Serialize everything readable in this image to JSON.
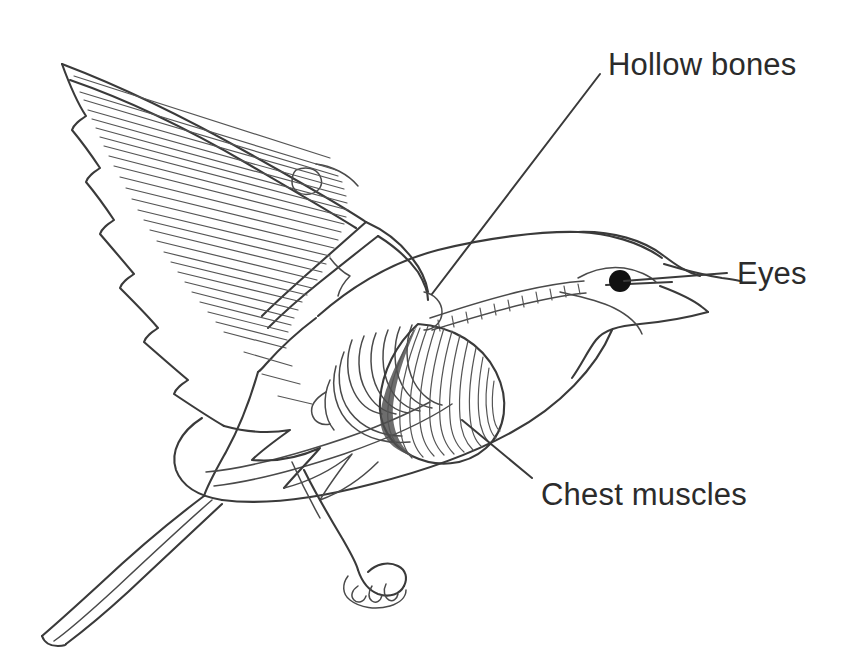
{
  "figure": {
    "background_color": "#ffffff",
    "ink_color": "#3a3a3a",
    "text_color": "#2b2b2b",
    "width": 850,
    "height": 667
  },
  "labels": [
    {
      "id": "hollow-bones",
      "text": "Hollow bones",
      "x": 608,
      "y": 75,
      "anchor": "start",
      "leader": {
        "x1": 600,
        "y1": 74,
        "x2": 432,
        "y2": 294
      }
    },
    {
      "id": "eyes",
      "text": "Eyes",
      "x": 737,
      "y": 284,
      "anchor": "start",
      "leader": {
        "x1": 727,
        "y1": 273,
        "x2": 624,
        "y2": 281
      }
    },
    {
      "id": "chest-muscles",
      "text": "Chest muscles",
      "x": 541,
      "y": 505,
      "anchor": "start",
      "leader": {
        "x1": 532,
        "y1": 478,
        "x2": 462,
        "y2": 420
      }
    }
  ],
  "anatomy": {
    "eye": {
      "cx": 620,
      "cy": 281,
      "r": 11,
      "color": "#111111"
    },
    "parts": [
      "wing-upper-outline",
      "wing-feather-barbs",
      "wing-primary-feathers",
      "wing-bone-humerus",
      "vertebral-column",
      "rib-cage",
      "chest-muscle-mass",
      "body-outline",
      "head-and-beak",
      "tail-feathers",
      "leg-and-foot"
    ]
  }
}
